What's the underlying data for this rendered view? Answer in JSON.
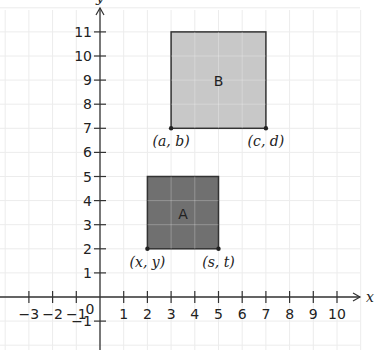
{
  "chart_data": {
    "type": "diagram",
    "title": "",
    "xlabel": "x",
    "ylabel": "y",
    "xlim": [
      -4,
      11
    ],
    "ylim": [
      -2,
      12
    ],
    "grid": true,
    "x_ticks": [
      -3,
      -2,
      -1,
      1,
      2,
      3,
      4,
      5,
      6,
      7,
      8,
      9,
      10
    ],
    "y_ticks": [
      -1,
      1,
      2,
      3,
      4,
      5,
      6,
      7,
      8,
      9,
      10,
      11
    ],
    "origin_label": "0",
    "shapes": [
      {
        "name": "A",
        "label": "A",
        "x0": 2,
        "y0": 2,
        "x1": 5,
        "y1": 5,
        "fill": "#707070",
        "corners": [
          {
            "label": "(x, y)",
            "x": 2,
            "y": 2
          },
          {
            "label": "(s, t)",
            "x": 5,
            "y": 2
          }
        ]
      },
      {
        "name": "B",
        "label": "B",
        "x0": 3,
        "y0": 7,
        "x1": 7,
        "y1": 11,
        "fill": "#c8c8c8",
        "corners": [
          {
            "label": "(a, b)",
            "x": 3,
            "y": 7
          },
          {
            "label": "(c, d)",
            "x": 7,
            "y": 7
          }
        ]
      }
    ]
  },
  "colors": {
    "grid": "#ececec",
    "axis": "#333333",
    "outline": "#333333"
  }
}
